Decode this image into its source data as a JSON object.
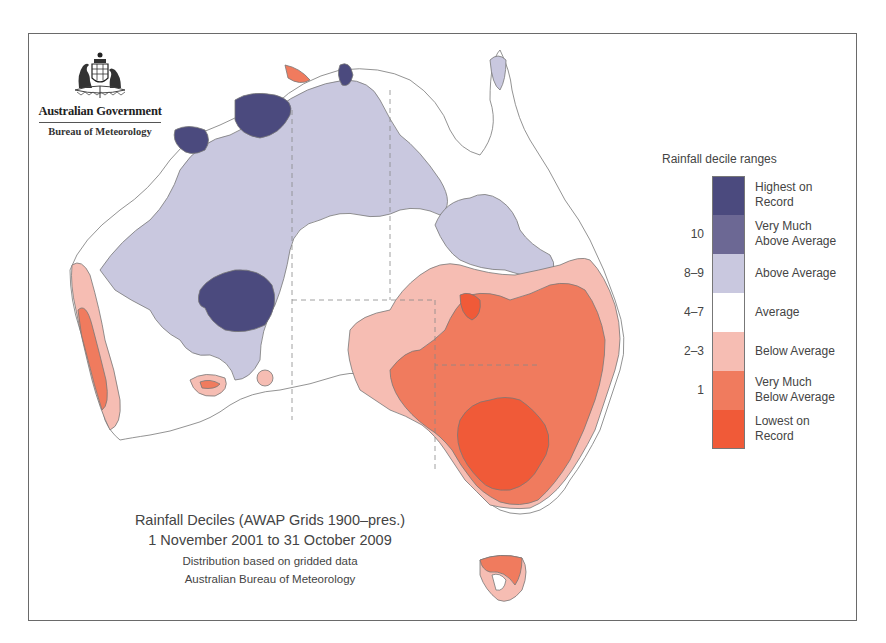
{
  "branding": {
    "government": "Australian Government",
    "agency": "Bureau of Meteorology",
    "emblem_icon": "coat-of-arms-icon"
  },
  "legend": {
    "title": "Rainfall decile ranges",
    "items": [
      {
        "range": "",
        "label_line1": "Highest on",
        "label_line2": "Record",
        "color": "#4b4a7e"
      },
      {
        "range": "10",
        "label_line1": "Very Much",
        "label_line2": "Above Average",
        "color": "#6c6894"
      },
      {
        "range": "8–9",
        "label_line1": "Above Average",
        "label_line2": "",
        "color": "#c9c8df"
      },
      {
        "range": "4–7",
        "label_line1": "Average",
        "label_line2": "",
        "color": "#ffffff"
      },
      {
        "range": "2–3",
        "label_line1": "Below Average",
        "label_line2": "",
        "color": "#f6bdb3"
      },
      {
        "range": "1",
        "label_line1": "Very Much",
        "label_line2": "Below Average",
        "color": "#f07b5e"
      },
      {
        "range": "",
        "label_line1": "Lowest on",
        "label_line2": "Record",
        "color": "#f05a38"
      }
    ]
  },
  "caption": {
    "title": "Rainfall Deciles (AWAP Grids 1900–pres.)",
    "period": "1 November 2001 to 31 October 2009",
    "note": "Distribution based on gridded data",
    "source": "Australian Bureau of Meteorology"
  },
  "map": {
    "region": "Australia",
    "colors": {
      "highest": "#4b4a7e",
      "very_much_above": "#6c6894",
      "above": "#c9c8df",
      "average": "#ffffff",
      "below": "#f6bdb3",
      "very_much_below": "#f07b5e",
      "lowest": "#f05a38",
      "outline": "#777777"
    }
  }
}
